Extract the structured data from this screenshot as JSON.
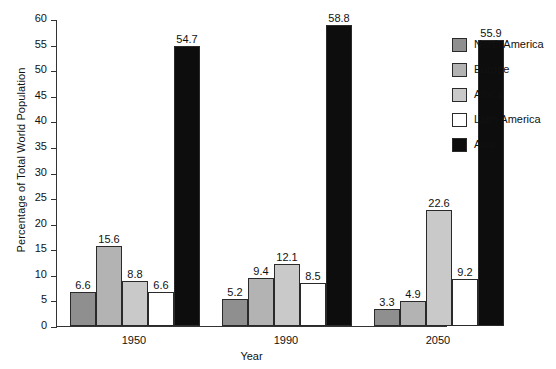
{
  "chart_data": {
    "type": "bar",
    "title": "",
    "subtitle": "",
    "xlabel": "Year",
    "ylabel": "Percentage of Total World Population",
    "categories": [
      "1950",
      "1990",
      "2050"
    ],
    "ylim": [
      0,
      60
    ],
    "yticks": [
      "0",
      "5",
      "10",
      "15",
      "20",
      "25",
      "30",
      "35",
      "40",
      "45",
      "50",
      "55",
      "60"
    ],
    "grid": false,
    "legend_position": "right",
    "series": [
      {
        "name": "North America",
        "color": "#8f8f8f",
        "values": [
          6.6,
          5.2,
          3.3
        ]
      },
      {
        "name": "Europe",
        "color": "#b3b3b3",
        "values": [
          15.6,
          9.4,
          4.9
        ]
      },
      {
        "name": "Africa",
        "color": "#c9c9c9",
        "values": [
          8.8,
          12.1,
          22.6
        ]
      },
      {
        "name": "Latin America",
        "color": "#ffffff",
        "values": [
          6.6,
          8.5,
          9.2
        ]
      },
      {
        "name": "Asia",
        "color": "#0d0d0d",
        "values": [
          54.7,
          58.8,
          55.9
        ]
      }
    ],
    "value_labels": [
      [
        "6.6",
        "15.6",
        "8.8",
        "6.6",
        "54.7"
      ],
      [
        "5.2",
        "9.4",
        "12.1",
        "8.5",
        "58.8"
      ],
      [
        "3.3",
        "4.9",
        "22.6",
        "9.2",
        "55.9"
      ]
    ]
  }
}
